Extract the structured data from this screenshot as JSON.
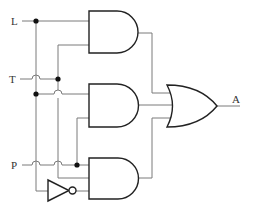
{
  "diagram": {
    "type": "logic-circuit",
    "inputs": [
      {
        "label": "L"
      },
      {
        "label": "T"
      },
      {
        "label": "P"
      }
    ],
    "output": {
      "label": "A"
    },
    "gates": [
      {
        "id": "and1",
        "type": "AND",
        "inputs": [
          "L",
          "T"
        ]
      },
      {
        "id": "and2",
        "type": "AND",
        "inputs": [
          "L",
          "P"
        ]
      },
      {
        "id": "and3",
        "type": "AND",
        "inputs": [
          "P",
          "T",
          "NOT L"
        ]
      },
      {
        "id": "not1",
        "type": "NOT",
        "inputs": [
          "L"
        ]
      },
      {
        "id": "or1",
        "type": "OR",
        "inputs": [
          "and1",
          "and2",
          "and3"
        ],
        "output": "A"
      }
    ],
    "colors": {
      "wire": "#7a7a7a",
      "gate_stroke": "#222222",
      "junction": "#111111",
      "background": "#ffffff"
    }
  }
}
